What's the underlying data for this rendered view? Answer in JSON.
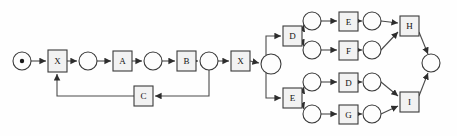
{
  "diagram": {
    "type": "petri-net",
    "canvas": {
      "width": 457,
      "height": 136
    },
    "colors": {
      "background": "#fefefe",
      "stroke": "#3a3a3a",
      "arc": "#4a4a4a",
      "transition_fill": "#f2f2f2",
      "place_fill": "#fdfdfd",
      "token": "#1a1a1a",
      "label": "#111111"
    },
    "places": [
      {
        "id": "p_start",
        "name": "start-place",
        "cx": 22,
        "cy": 61,
        "r": 9,
        "token": true
      },
      {
        "id": "p1",
        "name": "place-1",
        "cx": 88,
        "cy": 61,
        "r": 9,
        "token": false
      },
      {
        "id": "p2",
        "name": "place-2",
        "cx": 153,
        "cy": 61,
        "r": 9,
        "token": false
      },
      {
        "id": "p3",
        "name": "place-3",
        "cx": 209,
        "cy": 61,
        "r": 9,
        "token": false
      },
      {
        "id": "p_split",
        "name": "split-place",
        "cx": 271,
        "cy": 64,
        "r": 10,
        "token": false
      },
      {
        "id": "p_d1",
        "name": "place-branch-d-upper",
        "cx": 312,
        "cy": 21,
        "r": 9,
        "token": false
      },
      {
        "id": "p_d2",
        "name": "place-branch-d-lower",
        "cx": 312,
        "cy": 50,
        "r": 9,
        "token": false
      },
      {
        "id": "p_e1",
        "name": "place-branch-e-upper",
        "cx": 312,
        "cy": 82,
        "r": 9,
        "token": false
      },
      {
        "id": "p_e2",
        "name": "place-branch-e-lower",
        "cx": 312,
        "cy": 114,
        "r": 9,
        "token": false
      },
      {
        "id": "p_e_out",
        "name": "place-after-e",
        "cx": 372,
        "cy": 21,
        "r": 9,
        "token": false
      },
      {
        "id": "p_f_out",
        "name": "place-after-f",
        "cx": 372,
        "cy": 50,
        "r": 9,
        "token": false
      },
      {
        "id": "p_d_out",
        "name": "place-after-d2",
        "cx": 372,
        "cy": 82,
        "r": 9,
        "token": false
      },
      {
        "id": "p_g_out",
        "name": "place-after-g",
        "cx": 372,
        "cy": 114,
        "r": 9,
        "token": false
      },
      {
        "id": "p_end",
        "name": "end-place",
        "cx": 431,
        "cy": 63,
        "r": 9,
        "token": false
      }
    ],
    "transitions": [
      {
        "id": "t_x1",
        "name": "transition-x-first",
        "label": "X",
        "x": 48,
        "y": 50,
        "w": 19,
        "h": 22
      },
      {
        "id": "t_a",
        "name": "transition-a",
        "label": "A",
        "x": 113,
        "y": 51,
        "w": 19,
        "h": 20
      },
      {
        "id": "t_b",
        "name": "transition-b",
        "label": "B",
        "x": 177,
        "y": 51,
        "w": 19,
        "h": 20
      },
      {
        "id": "t_c",
        "name": "transition-c",
        "label": "C",
        "x": 134,
        "y": 86,
        "w": 19,
        "h": 20
      },
      {
        "id": "t_x2",
        "name": "transition-x-second",
        "label": "X",
        "x": 231,
        "y": 51,
        "w": 19,
        "h": 20
      },
      {
        "id": "t_d1",
        "name": "transition-d-upper",
        "label": "D",
        "x": 283,
        "y": 26,
        "w": 19,
        "h": 20
      },
      {
        "id": "t_e1",
        "name": "transition-e-lower",
        "label": "E",
        "x": 283,
        "y": 88,
        "w": 19,
        "h": 20
      },
      {
        "id": "t_e",
        "name": "transition-e-branch",
        "label": "E",
        "x": 339,
        "y": 12,
        "w": 19,
        "h": 19
      },
      {
        "id": "t_f",
        "name": "transition-f-branch",
        "label": "F",
        "x": 339,
        "y": 41,
        "w": 19,
        "h": 19
      },
      {
        "id": "t_d2",
        "name": "transition-d-branch",
        "label": "D",
        "x": 339,
        "y": 73,
        "w": 19,
        "h": 19
      },
      {
        "id": "t_g",
        "name": "transition-g-branch",
        "label": "G",
        "x": 339,
        "y": 105,
        "w": 19,
        "h": 19
      },
      {
        "id": "t_h",
        "name": "transition-h-join",
        "label": "H",
        "x": 400,
        "y": 16,
        "w": 19,
        "h": 20
      },
      {
        "id": "t_i",
        "name": "transition-i-join",
        "label": "I",
        "x": 400,
        "y": 92,
        "w": 19,
        "h": 20
      }
    ],
    "arcs": [
      {
        "name": "arc-start-to-x1",
        "d": "M31,61 L46,61"
      },
      {
        "name": "arc-x1-to-p1",
        "d": "M67,61 L77,61"
      },
      {
        "name": "arc-p1-to-a",
        "d": "M97,61 L111,61"
      },
      {
        "name": "arc-a-to-p2",
        "d": "M132,61 L142,61"
      },
      {
        "name": "arc-p2-to-b",
        "d": "M162,61 L175,61"
      },
      {
        "name": "arc-b-to-p3",
        "d": "M196,61 L198,61"
      },
      {
        "name": "arc-p3-to-c",
        "d": "M209,70 L209,96 L155,96"
      },
      {
        "name": "arc-c-to-x1",
        "d": "M134,96 L57,96 L57,74"
      },
      {
        "name": "arc-p3-to-x2",
        "d": "M218,61 L229,61"
      },
      {
        "name": "arc-x2-to-split",
        "d": "M250,61 L259,63"
      },
      {
        "name": "arc-split-to-d1",
        "d": "M266,55 L266,36 L281,36"
      },
      {
        "name": "arc-split-to-e1",
        "d": "M266,73 L266,98 L281,98"
      },
      {
        "name": "arc-d1-to-pd1",
        "d": "M302,31 L304,25"
      },
      {
        "name": "arc-d1-to-pd2",
        "d": "M302,41 L304,46"
      },
      {
        "name": "arc-e1-to-pe1",
        "d": "M302,93 L304,87"
      },
      {
        "name": "arc-e1-to-pe2",
        "d": "M302,103 L304,109"
      },
      {
        "name": "arc-pd1-to-e",
        "d": "M321,21 L337,21"
      },
      {
        "name": "arc-pd2-to-f",
        "d": "M321,50 L337,50"
      },
      {
        "name": "arc-pe1-to-d2",
        "d": "M321,82 L337,82"
      },
      {
        "name": "arc-pe2-to-g",
        "d": "M321,114 L337,114"
      },
      {
        "name": "arc-e-to-peout",
        "d": "M358,21 L362,21"
      },
      {
        "name": "arc-f-to-pfout",
        "d": "M358,50 L362,50"
      },
      {
        "name": "arc-d2-to-pdout",
        "d": "M358,82 L362,82"
      },
      {
        "name": "arc-g-to-pgout",
        "d": "M358,114 L362,114"
      },
      {
        "name": "arc-peout-to-h",
        "d": "M381,21 L398,23"
      },
      {
        "name": "arc-pfout-to-h",
        "d": "M381,50 L398,32"
      },
      {
        "name": "arc-pdout-to-i",
        "d": "M381,82 L398,96"
      },
      {
        "name": "arc-pgout-to-i",
        "d": "M381,114 L398,106"
      },
      {
        "name": "arc-h-to-end",
        "d": "M419,32 L428,54"
      },
      {
        "name": "arc-i-to-end",
        "d": "M419,96 L428,73"
      }
    ]
  }
}
